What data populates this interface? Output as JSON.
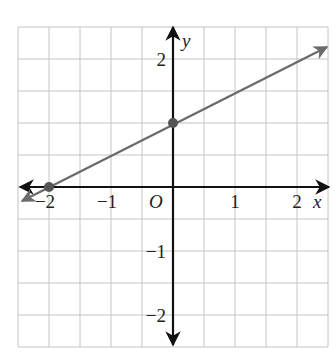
{
  "chart_data": {
    "type": "line",
    "title": "",
    "xlabel": "x",
    "ylabel": "y",
    "origin_label": "O",
    "xlim": [
      -2.5,
      2.5
    ],
    "ylim": [
      -2.5,
      2.5
    ],
    "grid": true,
    "grid_step": 0.5,
    "x_ticks": [
      {
        "value": -2,
        "label": "−2"
      },
      {
        "value": -1,
        "label": "−1"
      },
      {
        "value": 1,
        "label": "1"
      },
      {
        "value": 2,
        "label": "2"
      }
    ],
    "y_ticks": [
      {
        "value": 2,
        "label": "2"
      },
      {
        "value": -1,
        "label": "−1"
      },
      {
        "value": -2,
        "label": "−2"
      }
    ],
    "series": [
      {
        "name": "line",
        "equation": "y = 0.5x + 1",
        "x": [
          -2.4,
          2.5
        ],
        "y": [
          -0.2,
          2.25
        ],
        "points": [
          {
            "x": -2,
            "y": 0
          },
          {
            "x": 0,
            "y": 1
          }
        ],
        "arrows": "both",
        "color": "#6b6b6b"
      }
    ],
    "colors": {
      "grid": "#bdbdbd",
      "axes": "#111111",
      "line": "#6b6b6b",
      "points": "#555555"
    }
  }
}
